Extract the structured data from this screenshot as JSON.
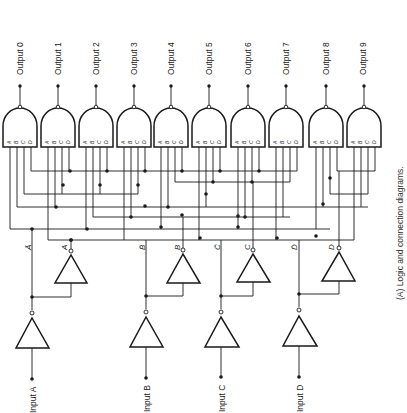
{
  "figure": {
    "caption": "(A)  Logic and connection diagrams.",
    "outputs": [
      "Output 0",
      "Output 1",
      "Output 2",
      "Output 3",
      "Output 4",
      "Output 5",
      "Output 6",
      "Output 7",
      "Output 8",
      "Output 9"
    ],
    "inputs": [
      "Input A",
      "Input B",
      "Input C",
      "Input D"
    ],
    "gate_pins": [
      "A",
      "B",
      "C",
      "D"
    ],
    "signals": {
      "a_bar": "Ā",
      "a": "A",
      "b_bar": "B̄",
      "b": "B",
      "c_bar": "C̄",
      "c": "C",
      "d_bar": "D̄",
      "d": "D"
    },
    "gate_type": "NAND (4-input)",
    "buffer_type": "inverter",
    "colors": {
      "ink": "#1a1a1a",
      "background": "#ffffff"
    }
  }
}
